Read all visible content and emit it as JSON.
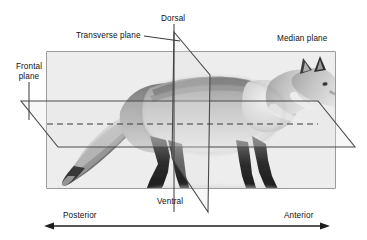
{
  "figure": {
    "labels": {
      "transverse_plane": "Transverse plane",
      "dorsal": "Dorsal",
      "median_plane": "Median plane",
      "frontal_plane": "Frontal\nplane",
      "frontal_plane_line1": "Frontal",
      "frontal_plane_line2": "plane",
      "ventral": "Ventral",
      "posterior": "Posterior",
      "anterior": "Anterior"
    },
    "colors": {
      "line": "#3a3a3a",
      "plane_fill": "#e8e8e8",
      "text": "#111111",
      "background": "#ffffff",
      "animal_dark": "#2b2b2b",
      "animal_mid": "#8d8d8d",
      "animal_light": "#d8d8d8"
    },
    "axis": {
      "left_direction": "Posterior",
      "right_direction": "Anterior",
      "arrow_style": "double-headed"
    },
    "planes": [
      {
        "name": "median_plane",
        "orientation": "sagittal / vertical-longitudinal"
      },
      {
        "name": "transverse_plane",
        "orientation": "vertical-cross-sectional"
      },
      {
        "name": "frontal_plane",
        "orientation": "horizontal-longitudinal"
      }
    ],
    "directions": [
      {
        "name": "dorsal",
        "position": "top"
      },
      {
        "name": "ventral",
        "position": "bottom"
      },
      {
        "name": "anterior",
        "position": "right"
      },
      {
        "name": "posterior",
        "position": "left"
      }
    ]
  }
}
